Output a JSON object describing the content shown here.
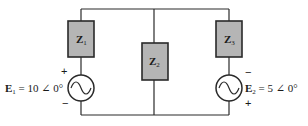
{
  "diagram": {
    "type": "ac-circuit",
    "impedances": [
      {
        "symbol": "Z",
        "subscript": "1"
      },
      {
        "symbol": "Z",
        "subscript": "2"
      },
      {
        "symbol": "Z",
        "subscript": "3"
      }
    ],
    "sources": [
      {
        "symbol": "E",
        "subscript": "1",
        "equation": " = 10 ∠ 0°",
        "top_polarity": "+",
        "bottom_polarity": "−"
      },
      {
        "symbol": "E",
        "subscript": "2",
        "equation": " = 5 ∠ 0°",
        "top_polarity": "−",
        "bottom_polarity": "+"
      }
    ],
    "colors": {
      "impedance_fill": "#b5b5b5",
      "wire": "#2a2a2a"
    }
  }
}
